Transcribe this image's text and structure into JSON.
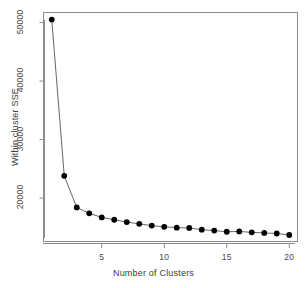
{
  "chart_data": {
    "type": "line",
    "title": "",
    "xlabel": "Number of Clusters",
    "ylabel": "Within cluster SSE",
    "x": [
      1,
      2,
      3,
      4,
      5,
      6,
      7,
      8,
      9,
      10,
      11,
      12,
      13,
      14,
      15,
      16,
      17,
      18,
      19,
      20
    ],
    "values": [
      50500,
      23800,
      18400,
      17400,
      16700,
      16300,
      15900,
      15600,
      15300,
      15100,
      14950,
      14900,
      14600,
      14450,
      14250,
      14300,
      14150,
      14050,
      13950,
      13700
    ],
    "series": [
      {
        "name": "Within cluster SSE",
        "values": [
          50500,
          23800,
          18400,
          17400,
          16700,
          16300,
          15900,
          15600,
          15300,
          15100,
          14950,
          14900,
          14600,
          14450,
          14250,
          14300,
          14150,
          14050,
          13950,
          13700
        ]
      }
    ],
    "xlim": [
      0.3,
      20.7
    ],
    "ylim": [
      12500,
      51800
    ],
    "xticks": [
      5,
      10,
      15,
      20
    ],
    "xtick_labels": [
      "5",
      "10",
      "15",
      "20"
    ],
    "yticks": [
      20000,
      30000,
      40000,
      50000
    ],
    "ytick_labels": [
      "20000",
      "30000",
      "40000",
      "50000"
    ],
    "grid": false,
    "legend": null,
    "marker": "filled-circle",
    "marker_color": "#000000",
    "line_color": "#555555",
    "background_color": "#ffffff",
    "frame_color": "#8c8c8c"
  }
}
